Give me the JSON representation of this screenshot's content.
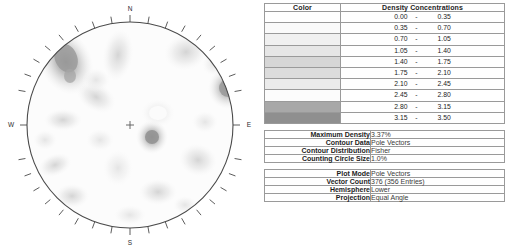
{
  "chart_data": {
    "type": "contour",
    "title": "",
    "plot_kind": "stereonet-density-contour",
    "projection": "Equal Angle",
    "hemisphere": "Lower",
    "compass_labels": {
      "north": "N",
      "south": "S",
      "east": "E",
      "west": "W"
    },
    "center_marker": "+",
    "maximum_density": "3.37%",
    "counting_circle_size": "1.0%",
    "contour_distribution": "Fisher",
    "contour_data": "Pole Vectors",
    "vector_count": "376 (356 Entries)",
    "legend_bands": [
      {
        "lo": "0.00",
        "hi": "0.35",
        "color": "#ffffff"
      },
      {
        "lo": "0.35",
        "hi": "0.70",
        "color": "#fafafa"
      },
      {
        "lo": "0.70",
        "hi": "1.05",
        "color": "#f0f0f0"
      },
      {
        "lo": "1.05",
        "hi": "1.40",
        "color": "#e6e6e6"
      },
      {
        "lo": "1.40",
        "hi": "1.75",
        "color": "#d6d6d6"
      },
      {
        "lo": "1.75",
        "hi": "2.10",
        "color": "#dcdcdc"
      },
      {
        "lo": "2.10",
        "hi": "2.45",
        "color": "#ebebeb"
      },
      {
        "lo": "2.45",
        "hi": "2.80",
        "color": "#fcfcfc"
      },
      {
        "lo": "2.80",
        "hi": "3.15",
        "color": "#a8a8a8"
      },
      {
        "lo": "3.15",
        "hi": "3.50",
        "color": "#8f8f8f"
      }
    ],
    "blobs": [
      {
        "cx": 66,
        "cy": 62,
        "rx": 15,
        "ry": 22,
        "rot": -25,
        "peak": 3.4
      },
      {
        "cx": 228,
        "cy": 88,
        "rx": 12,
        "ry": 13,
        "rot": 10,
        "peak": 3.3
      },
      {
        "cx": 152,
        "cy": 137,
        "rx": 9,
        "ry": 10,
        "rot": 0,
        "peak": 3.2
      },
      {
        "cx": 118,
        "cy": 55,
        "rx": 12,
        "ry": 20,
        "rot": 8,
        "peak": 1.6
      },
      {
        "cx": 186,
        "cy": 52,
        "rx": 17,
        "ry": 14,
        "rot": -15,
        "peak": 1.7
      },
      {
        "cx": 96,
        "cy": 97,
        "rx": 16,
        "ry": 11,
        "rot": 30,
        "peak": 1.5
      },
      {
        "cx": 63,
        "cy": 120,
        "rx": 15,
        "ry": 9,
        "rot": 0,
        "peak": 1.5
      },
      {
        "cx": 55,
        "cy": 165,
        "rx": 13,
        "ry": 9,
        "rot": -20,
        "peak": 1.5
      },
      {
        "cx": 198,
        "cy": 160,
        "rx": 14,
        "ry": 12,
        "rot": 15,
        "peak": 1.6
      },
      {
        "cx": 158,
        "cy": 113,
        "rx": 13,
        "ry": 11,
        "rot": 0,
        "peak": 1.3
      },
      {
        "cx": 72,
        "cy": 196,
        "rx": 13,
        "ry": 10,
        "rot": 0,
        "peak": 1.4
      },
      {
        "cx": 158,
        "cy": 192,
        "rx": 14,
        "ry": 10,
        "rot": 0,
        "peak": 1.4
      },
      {
        "cx": 205,
        "cy": 122,
        "rx": 10,
        "ry": 9,
        "rot": 0,
        "peak": 1.1
      },
      {
        "cx": 118,
        "cy": 168,
        "rx": 12,
        "ry": 14,
        "rot": 0,
        "peak": 1.1
      },
      {
        "cx": 100,
        "cy": 140,
        "rx": 11,
        "ry": 9,
        "rot": 0,
        "peak": 1.0
      }
    ]
  },
  "legend_table": {
    "header_color": "Color",
    "header_density": "Density Concentrations",
    "dash": "-"
  },
  "contour_info": {
    "rows": [
      {
        "label": "Maximum Density",
        "value": "3.37%"
      },
      {
        "label": "Contour Data",
        "value": "Pole Vectors"
      },
      {
        "label": "Contour Distribution",
        "value": "Fisher"
      },
      {
        "label": "Counting Circle Size",
        "value": "1.0%"
      }
    ]
  },
  "plot_info": {
    "rows": [
      {
        "label": "Plot Mode",
        "value": "Pole Vectors"
      },
      {
        "label": "Vector Count",
        "value": "376 (356 Entries)"
      },
      {
        "label": "Hemisphere",
        "value": "Lower"
      },
      {
        "label": "Projection",
        "value": "Equal Angle"
      }
    ]
  }
}
